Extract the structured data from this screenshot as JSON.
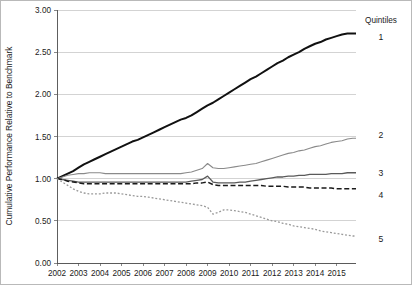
{
  "chart_data": {
    "type": "line",
    "title": "",
    "subtitle": "",
    "xlabel": "",
    "ylabel": "Cumulative Performance Relative to Benchmark",
    "xlim": [
      2002,
      2015.9
    ],
    "ylim": [
      0.0,
      3.0
    ],
    "grid": true,
    "grid_axis": "y",
    "legend_position": "right",
    "legend_title": "Quintiles",
    "y_ticks": [
      0.0,
      0.5,
      1.0,
      1.5,
      2.0,
      2.5,
      3.0
    ],
    "y_tick_labels": [
      "0.00",
      "0.50",
      "1.00",
      "1.50",
      "2.00",
      "2.50",
      "3.00"
    ],
    "x_ticks": [
      2002,
      2003,
      2004,
      2005,
      2006,
      2007,
      2008,
      2009,
      2010,
      2011,
      2012,
      2013,
      2014,
      2015
    ],
    "x_tick_labels": [
      "2002",
      "2003",
      "2004",
      "2005",
      "2006",
      "2007",
      "2008",
      "2009",
      "2010",
      "2011",
      "2012",
      "2013",
      "2014",
      "2015"
    ],
    "x": [
      2002.0,
      2002.25,
      2002.5,
      2002.75,
      2003.0,
      2003.25,
      2003.5,
      2003.75,
      2004.0,
      2004.25,
      2004.5,
      2004.75,
      2005.0,
      2005.25,
      2005.5,
      2005.75,
      2006.0,
      2006.25,
      2006.5,
      2006.75,
      2007.0,
      2007.25,
      2007.5,
      2007.75,
      2008.0,
      2008.25,
      2008.5,
      2008.75,
      2009.0,
      2009.25,
      2009.5,
      2009.75,
      2010.0,
      2010.25,
      2010.5,
      2010.75,
      2011.0,
      2011.25,
      2011.5,
      2011.75,
      2012.0,
      2012.25,
      2012.5,
      2012.75,
      2013.0,
      2013.25,
      2013.5,
      2013.75,
      2014.0,
      2014.25,
      2014.5,
      2014.75,
      2015.0,
      2015.25,
      2015.5,
      2015.75,
      2015.9
    ],
    "series": [
      {
        "name": "1",
        "legend_label": "1",
        "style": "solid-thick-black",
        "color": "#111111",
        "end_value": 2.72,
        "values": [
          1.0,
          1.03,
          1.06,
          1.09,
          1.13,
          1.17,
          1.2,
          1.23,
          1.26,
          1.29,
          1.32,
          1.35,
          1.38,
          1.41,
          1.44,
          1.46,
          1.49,
          1.52,
          1.55,
          1.58,
          1.61,
          1.64,
          1.67,
          1.7,
          1.72,
          1.75,
          1.79,
          1.83,
          1.87,
          1.9,
          1.94,
          1.98,
          2.02,
          2.06,
          2.1,
          2.14,
          2.18,
          2.21,
          2.25,
          2.29,
          2.33,
          2.37,
          2.4,
          2.44,
          2.47,
          2.5,
          2.54,
          2.57,
          2.6,
          2.62,
          2.65,
          2.67,
          2.69,
          2.71,
          2.72,
          2.72,
          2.72
        ]
      },
      {
        "name": "2",
        "legend_label": "2",
        "style": "solid-gray",
        "color": "#8a8a8a",
        "end_value": 1.48,
        "values": [
          1.0,
          1.02,
          1.04,
          1.05,
          1.06,
          1.06,
          1.07,
          1.07,
          1.07,
          1.06,
          1.06,
          1.06,
          1.06,
          1.06,
          1.06,
          1.06,
          1.06,
          1.06,
          1.06,
          1.06,
          1.06,
          1.06,
          1.06,
          1.06,
          1.07,
          1.08,
          1.1,
          1.12,
          1.18,
          1.13,
          1.12,
          1.12,
          1.13,
          1.14,
          1.15,
          1.16,
          1.17,
          1.18,
          1.2,
          1.22,
          1.24,
          1.26,
          1.28,
          1.3,
          1.31,
          1.33,
          1.34,
          1.36,
          1.38,
          1.39,
          1.41,
          1.43,
          1.44,
          1.45,
          1.47,
          1.48,
          1.48
        ]
      },
      {
        "name": "3",
        "legend_label": "3",
        "style": "solid-dark-gray",
        "color": "#5a5a5a",
        "end_value": 1.07,
        "values": [
          1.0,
          0.99,
          0.98,
          0.97,
          0.96,
          0.96,
          0.96,
          0.96,
          0.96,
          0.96,
          0.96,
          0.96,
          0.96,
          0.96,
          0.96,
          0.96,
          0.96,
          0.96,
          0.96,
          0.96,
          0.96,
          0.96,
          0.96,
          0.96,
          0.96,
          0.97,
          0.98,
          0.99,
          1.03,
          0.96,
          0.95,
          0.95,
          0.95,
          0.95,
          0.96,
          0.96,
          0.97,
          0.98,
          0.99,
          1.0,
          1.01,
          1.02,
          1.02,
          1.03,
          1.03,
          1.04,
          1.04,
          1.05,
          1.05,
          1.05,
          1.05,
          1.06,
          1.06,
          1.06,
          1.07,
          1.07,
          1.07
        ]
      },
      {
        "name": "4",
        "legend_label": "4",
        "style": "dashed-black",
        "color": "#1a1a1a",
        "end_value": 0.88,
        "values": [
          1.0,
          0.99,
          0.97,
          0.96,
          0.95,
          0.94,
          0.94,
          0.94,
          0.94,
          0.94,
          0.94,
          0.94,
          0.94,
          0.94,
          0.94,
          0.94,
          0.94,
          0.94,
          0.94,
          0.94,
          0.94,
          0.94,
          0.94,
          0.94,
          0.94,
          0.94,
          0.95,
          0.95,
          0.96,
          0.93,
          0.92,
          0.92,
          0.92,
          0.92,
          0.92,
          0.92,
          0.92,
          0.92,
          0.92,
          0.91,
          0.91,
          0.91,
          0.91,
          0.9,
          0.9,
          0.9,
          0.9,
          0.89,
          0.89,
          0.89,
          0.89,
          0.89,
          0.88,
          0.88,
          0.88,
          0.88,
          0.88
        ]
      },
      {
        "name": "5",
        "legend_label": "5",
        "style": "dotted-gray",
        "color": "#9a9a9a",
        "end_value": 0.32,
        "values": [
          1.0,
          0.96,
          0.92,
          0.88,
          0.85,
          0.83,
          0.82,
          0.82,
          0.82,
          0.83,
          0.83,
          0.83,
          0.82,
          0.81,
          0.8,
          0.79,
          0.79,
          0.78,
          0.77,
          0.76,
          0.75,
          0.74,
          0.73,
          0.72,
          0.71,
          0.7,
          0.69,
          0.68,
          0.66,
          0.58,
          0.6,
          0.63,
          0.63,
          0.62,
          0.61,
          0.6,
          0.58,
          0.56,
          0.54,
          0.52,
          0.5,
          0.49,
          0.47,
          0.46,
          0.44,
          0.43,
          0.42,
          0.41,
          0.4,
          0.38,
          0.37,
          0.36,
          0.35,
          0.34,
          0.33,
          0.32,
          0.32
        ]
      }
    ],
    "annotations": []
  },
  "legend": {
    "title": "Quintiles",
    "entries": [
      "1",
      "2",
      "3",
      "4",
      "5"
    ]
  },
  "axes": {
    "y_title": "Cumulative Performance Relative to Benchmark"
  },
  "colors": {
    "gridline": "#c8c8c8",
    "axis": "#4d4d4d",
    "text": "#1a1a1a",
    "background": "#ffffff",
    "border": "#b9b9b9"
  }
}
